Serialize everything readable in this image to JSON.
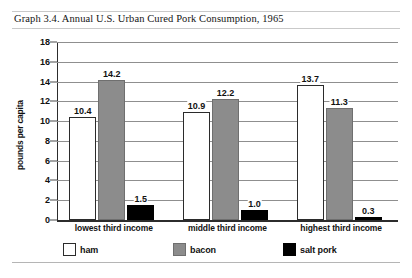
{
  "chart_data": {
    "type": "bar",
    "title": "Graph 3.4. Annual U.S. Urban Cured Pork Consumption, 1965",
    "xlabel": "",
    "ylabel": "pounds per capita",
    "ylim": [
      0,
      18
    ],
    "yticks": [
      0,
      2,
      4,
      6,
      8,
      10,
      12,
      14,
      16,
      18
    ],
    "ytick_labels": [
      "0",
      "2",
      "4",
      "6",
      "8",
      "10",
      "12",
      "14",
      "16",
      "18"
    ],
    "grid": true,
    "legend_position": "bottom",
    "categories": [
      "lowest third income",
      "middle third income",
      "highest third income"
    ],
    "series": [
      {
        "name": "ham",
        "color": "#ffffff",
        "values": [
          10.4,
          10.9,
          13.7
        ],
        "labels": [
          "10.4",
          "10.9",
          "13.7"
        ]
      },
      {
        "name": "bacon",
        "color": "#8c8c8c",
        "values": [
          14.2,
          12.2,
          11.3
        ],
        "labels": [
          "14.2",
          "12.2",
          "11.3"
        ]
      },
      {
        "name": "salt pork",
        "color": "#000000",
        "values": [
          1.5,
          1.0,
          0.3
        ],
        "labels": [
          "1.5",
          "1.0",
          "0.3"
        ]
      }
    ]
  }
}
